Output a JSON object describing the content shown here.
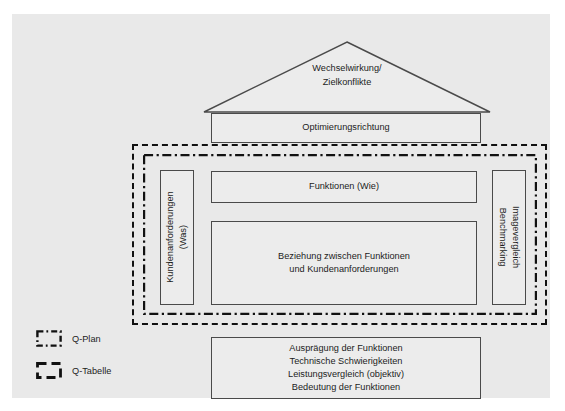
{
  "diagram": {
    "background_color": "#e9e9e9",
    "box_fill_color": "#ececec",
    "box_border_color": "#4a4a4a",
    "frame_color": "#111111"
  },
  "roof": {
    "name": "roof-triangle",
    "label_line_1": "Wechselwirkung/",
    "label_line_2": "Zielkonflikte"
  },
  "optimization": {
    "label": "Optimierungsrichtung"
  },
  "functions": {
    "label": "Funktionen (Wie)"
  },
  "matrix": {
    "line_1": "Beziehung zwischen Funktionen",
    "line_2": "und Kundenanforderungen"
  },
  "left_panel": {
    "line_1": "Kundenanforderungen",
    "line_2": "(Was)",
    "rotation": "-90"
  },
  "right_panel": {
    "line_1": "Imagevergleich",
    "line_2": "Benchmarking",
    "rotation": "90"
  },
  "bottom_panel": {
    "lines": [
      "Ausprägung der Funktionen",
      "Technische Schwierigkeiten",
      "Leistungsvergleich (objektiv)",
      "Bedeutung der Funktionen"
    ]
  },
  "frames": {
    "q_plan": {
      "label": "Q-Plan",
      "style": "dash-dot"
    },
    "q_tabelle": {
      "label": "Q-Tabelle",
      "style": "dashed"
    }
  },
  "legend": {
    "items": [
      {
        "label": "Q-Plan",
        "swatch": "dash-dot-square-icon"
      },
      {
        "label": "Q-Tabelle",
        "swatch": "dashed-square-icon"
      }
    ]
  }
}
